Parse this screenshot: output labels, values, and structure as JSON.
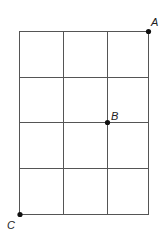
{
  "diagram": {
    "type": "grid",
    "columns": 3,
    "rows": 4,
    "x_lines": [
      19,
      63,
      107,
      149
    ],
    "y_lines": [
      31,
      77,
      122,
      168,
      214
    ],
    "line_color": "#555555",
    "points": [
      {
        "label": "A",
        "x": 148,
        "y": 31,
        "lx": 151,
        "ly": 26
      },
      {
        "label": "B",
        "x": 107,
        "y": 122,
        "lx": 111,
        "ly": 119
      },
      {
        "label": "C",
        "x": 20,
        "y": 214,
        "lx": 7,
        "ly": 229
      }
    ]
  }
}
